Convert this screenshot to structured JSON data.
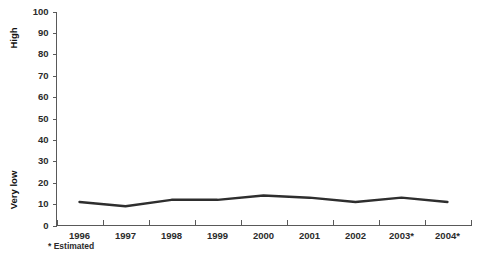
{
  "chart_data": {
    "type": "line",
    "title": "",
    "subtitle": "",
    "xlabel": "",
    "ylabel": "",
    "categories": [
      "1996",
      "1997",
      "1998",
      "1999",
      "2000",
      "2001",
      "2002",
      "2003*",
      "2004*"
    ],
    "values": [
      11,
      9,
      12,
      12,
      14,
      13,
      11,
      13,
      11
    ],
    "series": [
      {
        "name": "",
        "values": [
          11,
          9,
          12,
          12,
          14,
          13,
          11,
          13,
          11
        ]
      }
    ],
    "ylim": [
      0,
      100
    ],
    "y_ticks": [
      0,
      10,
      20,
      30,
      40,
      50,
      60,
      70,
      80,
      90,
      100
    ],
    "y_tick_labels": [
      "0",
      "10",
      "20",
      "30",
      "40",
      "50",
      "60",
      "70",
      "80",
      "90",
      "100"
    ],
    "y_axis_top_label": "High",
    "y_axis_bottom_label": "Very low",
    "grid": false,
    "legend": "none",
    "line_color": "#2e2e2e",
    "axis_color": "#595959",
    "background_color": "#ffffff",
    "footnote": "* Estimated"
  },
  "axis": {
    "y_top_annotation": "High",
    "y_bottom_annotation": "Very low"
  },
  "footnote": {
    "text": "* Estimated"
  }
}
